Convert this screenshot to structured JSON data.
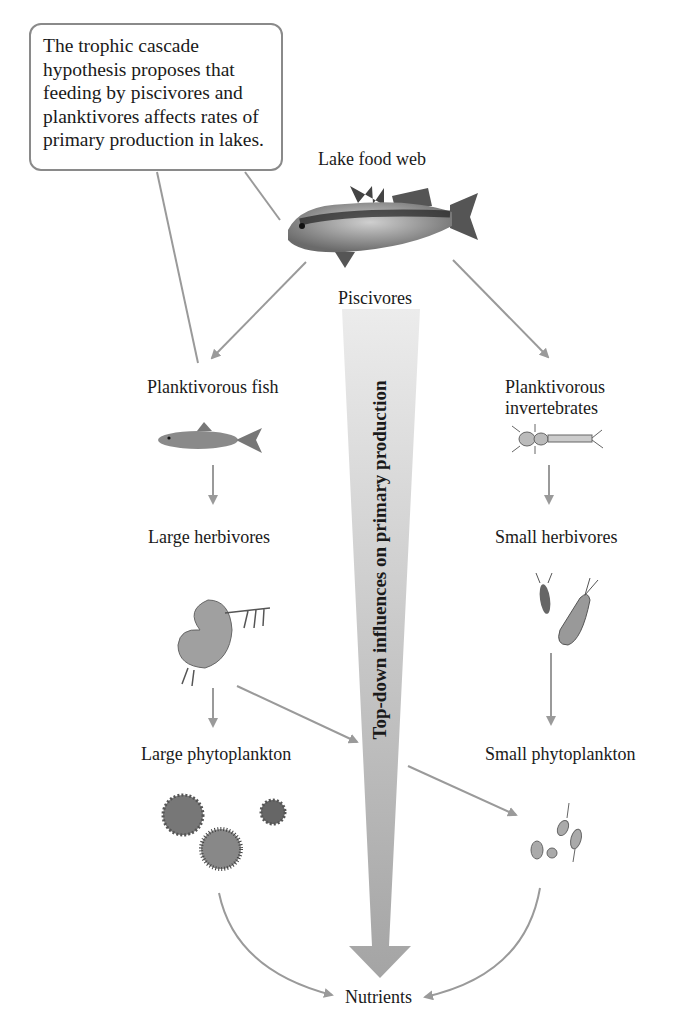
{
  "callout": {
    "text_lines": [
      "The trophic cascade",
      "hypothesis proposes that",
      "feeding by piscivores and",
      "planktivores affects rates of",
      "primary production in lakes."
    ]
  },
  "title": "Lake food web",
  "nodes": {
    "piscivores": "Piscivores",
    "planktivorous_fish": "Planktivorous fish",
    "planktivorous_invertebrates_line1": "Planktivorous",
    "planktivorous_invertebrates_line2": "invertebrates",
    "large_herbivores": "Large herbivores",
    "small_herbivores": "Small herbivores",
    "large_phytoplankton": "Large phytoplankton",
    "small_phytoplankton": "Small phytoplankton",
    "nutrients": "Nutrients"
  },
  "big_arrow_label": "Top-down influences on primary production",
  "icons": [
    "bass-fish-icon",
    "minnow-fish-icon",
    "insect-larva-icon",
    "daphnia-icon",
    "copepod-icon",
    "large-phytoplankton-icon",
    "small-phytoplankton-icon"
  ],
  "colors": {
    "arrow": "#9a9a9a",
    "big_arrow_top": "#e8e8e8",
    "big_arrow_bottom": "#a8a8a8",
    "callout_border": "#8a8a8a",
    "text": "#1a1a1a"
  }
}
